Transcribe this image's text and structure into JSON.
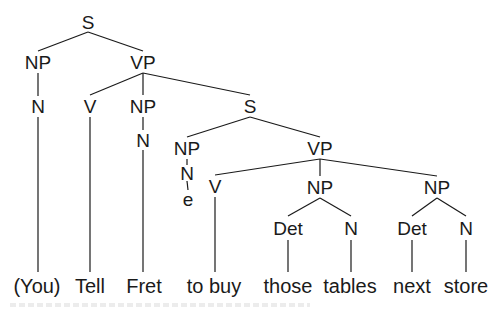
{
  "diagram": {
    "type": "syntax-tree",
    "line_color": "#1a1a1a",
    "nodes": [
      {
        "id": "s1",
        "label": "S",
        "x": 88,
        "y": 22
      },
      {
        "id": "np1",
        "label": "NP",
        "x": 38,
        "y": 62
      },
      {
        "id": "vp1",
        "label": "VP",
        "x": 143,
        "y": 62
      },
      {
        "id": "n1",
        "label": "N",
        "x": 38,
        "y": 106
      },
      {
        "id": "v1",
        "label": "V",
        "x": 90,
        "y": 106
      },
      {
        "id": "np2",
        "label": "NP",
        "x": 143,
        "y": 106
      },
      {
        "id": "s2",
        "label": "S",
        "x": 250,
        "y": 106
      },
      {
        "id": "n2",
        "label": "N",
        "x": 143,
        "y": 140
      },
      {
        "id": "np3",
        "label": "NP",
        "x": 187,
        "y": 148
      },
      {
        "id": "vp2",
        "label": "VP",
        "x": 320,
        "y": 148
      },
      {
        "id": "n3",
        "label": "N",
        "x": 187,
        "y": 173
      },
      {
        "id": "v2",
        "label": "V",
        "x": 215,
        "y": 186
      },
      {
        "id": "np4",
        "label": "NP",
        "x": 320,
        "y": 187
      },
      {
        "id": "np5",
        "label": "NP",
        "x": 437,
        "y": 187
      },
      {
        "id": "e1",
        "label": "e",
        "x": 188,
        "y": 199
      },
      {
        "id": "det1",
        "label": "Det",
        "x": 288,
        "y": 228
      },
      {
        "id": "n4",
        "label": "N",
        "x": 351,
        "y": 228
      },
      {
        "id": "det2",
        "label": "Det",
        "x": 412,
        "y": 228
      },
      {
        "id": "n5",
        "label": "N",
        "x": 466,
        "y": 228
      }
    ],
    "edges": [
      [
        88,
        32,
        38,
        51
      ],
      [
        88,
        32,
        143,
        51
      ],
      [
        38,
        73,
        38,
        96
      ],
      [
        143,
        73,
        90,
        95
      ],
      [
        143,
        73,
        143,
        95
      ],
      [
        143,
        73,
        250,
        95
      ],
      [
        143,
        117,
        143,
        130
      ],
      [
        250,
        117,
        187,
        137
      ],
      [
        250,
        117,
        320,
        137
      ],
      [
        187,
        159,
        187,
        165
      ],
      [
        187,
        181,
        188,
        190
      ],
      [
        320,
        159,
        215,
        175
      ],
      [
        320,
        159,
        320,
        176
      ],
      [
        320,
        159,
        437,
        176
      ],
      [
        320,
        198,
        288,
        216
      ],
      [
        320,
        198,
        351,
        216
      ],
      [
        437,
        198,
        412,
        216
      ],
      [
        437,
        198,
        466,
        216
      ],
      [
        38,
        117,
        38,
        272
      ],
      [
        90,
        117,
        90,
        272
      ],
      [
        143,
        150,
        143,
        272
      ],
      [
        215,
        197,
        215,
        272
      ],
      [
        288,
        240,
        288,
        272
      ],
      [
        351,
        240,
        351,
        272
      ],
      [
        412,
        240,
        412,
        272
      ],
      [
        466,
        240,
        466,
        272
      ]
    ],
    "words": [
      {
        "text": "(You)",
        "x": 37,
        "y": 286
      },
      {
        "text": "Tell",
        "x": 90,
        "y": 286
      },
      {
        "text": "Fret",
        "x": 144,
        "y": 286
      },
      {
        "text": "to buy",
        "x": 214,
        "y": 286
      },
      {
        "text": "those",
        "x": 288,
        "y": 286
      },
      {
        "text": "tables",
        "x": 350,
        "y": 286
      },
      {
        "text": "next",
        "x": 412,
        "y": 286
      },
      {
        "text": "store",
        "x": 466,
        "y": 286
      }
    ]
  }
}
